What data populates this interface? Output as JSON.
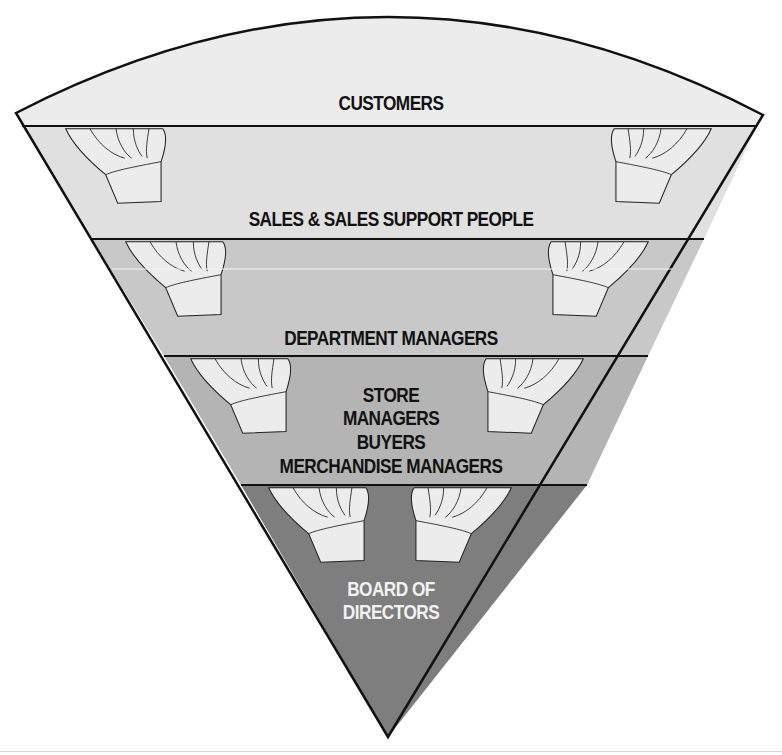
{
  "diagram": {
    "colors": {
      "band_customers": "#ececec",
      "band_sales": "#e0e0e0",
      "band_department": "#c8c8c8",
      "band_store": "#b4b4b4",
      "band_board": "#7e7e7e",
      "outline": "#111111",
      "hand_fill": "#ececec"
    },
    "levels": [
      {
        "id": "customers",
        "lines": [
          "CUSTOMERS"
        ]
      },
      {
        "id": "sales",
        "lines": [
          "SALES & SALES SUPPORT PEOPLE"
        ]
      },
      {
        "id": "department",
        "lines": [
          "DEPARTMENT MANAGERS"
        ]
      },
      {
        "id": "store",
        "lines": [
          "STORE",
          "MANAGERS",
          "BUYERS",
          "MERCHANDISE MANAGERS"
        ]
      },
      {
        "id": "board",
        "lines": [
          "BOARD OF",
          "DIRECTORS"
        ]
      }
    ],
    "hand_icon": "supporting-hand-icon"
  }
}
